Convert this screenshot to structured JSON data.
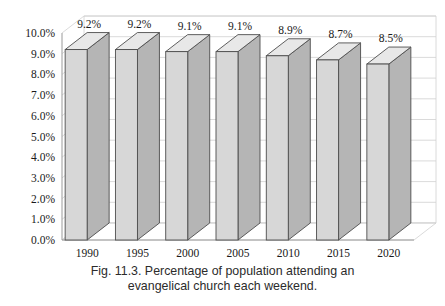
{
  "figure": {
    "caption_line1": "Fig. 11.3. Percentage of population attending an",
    "caption_line2": "evangelical church each weekend."
  },
  "colors": {
    "bar_front": "#d7d7d7",
    "bar_side": "#b5b5b5",
    "bar_top": "#e8e8e8",
    "bar_outline": "#4d4d4d",
    "grid": "#d0d0d0",
    "axis": "#9a9a9a",
    "text": "#1a1a1a",
    "background": "#ffffff"
  },
  "chart_data": {
    "type": "bar",
    "title": "",
    "xlabel": "",
    "ylabel": "",
    "categories": [
      "1990",
      "1995",
      "2000",
      "2005",
      "2010",
      "2015",
      "2020"
    ],
    "values": [
      9.2,
      9.2,
      9.1,
      9.1,
      8.9,
      8.7,
      8.5
    ],
    "value_labels": [
      "9.2%",
      "9.2%",
      "9.1%",
      "9.1%",
      "8.9%",
      "8.7%",
      "8.5%"
    ],
    "ylim": [
      0,
      10
    ],
    "ytick_values": [
      0,
      1,
      2,
      3,
      4,
      5,
      6,
      7,
      8,
      9,
      10
    ],
    "ytick_labels": [
      "0.0%",
      "1.0%",
      "2.0%",
      "3.0%",
      "4.0%",
      "5.0%",
      "6.0%",
      "7.0%",
      "8.0%",
      "9.0%",
      "10.0%"
    ],
    "grid": true,
    "legend": false,
    "three_d": true
  }
}
